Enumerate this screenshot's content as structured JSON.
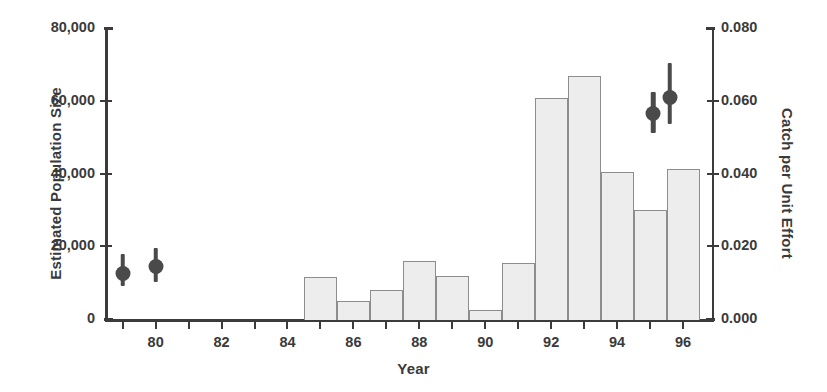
{
  "chart_data": {
    "type": "bar",
    "title": "",
    "xlabel": "Year",
    "ylabel": "Estimated Population Size",
    "ylabel_right": "Catch per Unit Effort",
    "grid": false,
    "legend": "none",
    "xlim": [
      78.5,
      96.9
    ],
    "ylim": [
      0,
      80000
    ],
    "ylim_right": [
      0.0,
      0.08
    ],
    "x_tick_values": [
      79,
      80,
      81,
      82,
      83,
      84,
      85,
      86,
      87,
      88,
      89,
      90,
      91,
      92,
      93,
      94,
      95,
      96
    ],
    "x_tick_labels": [
      "",
      "80",
      "",
      "82",
      "",
      "84",
      "",
      "86",
      "",
      "88",
      "",
      "90",
      "",
      "92",
      "",
      "94",
      "",
      "96"
    ],
    "y_tick_values": [
      0,
      20000,
      40000,
      60000,
      80000
    ],
    "y_tick_labels": [
      "0",
      "20,000",
      "40,000",
      "60,000",
      "80,000"
    ],
    "y_right_tick_values": [
      0.0,
      0.02,
      0.04,
      0.06,
      0.08
    ],
    "y_right_tick_labels": [
      "0.000",
      "0.020",
      "0.040",
      "0.060",
      "0.080"
    ],
    "series": [
      {
        "name": "Catch per Unit Effort",
        "type": "bar",
        "axis": "right",
        "bar_align": "year-interval",
        "categories": [
          85,
          86,
          87,
          88,
          89,
          90,
          91,
          92,
          93,
          94,
          95,
          96
        ],
        "values": [
          0.0118,
          0.0053,
          0.0083,
          0.0163,
          0.012,
          0.0027,
          0.0158,
          0.061,
          0.067,
          0.0407,
          0.0303,
          0.0415
        ],
        "values_left_axis": [
          11800,
          5300,
          8300,
          16300,
          12000,
          2700,
          15800,
          61000,
          67000,
          40700,
          30300,
          41500
        ]
      },
      {
        "name": "Estimated Population Size",
        "type": "scatter-errorbar",
        "axis": "left",
        "x": [
          79.0,
          80.0,
          95.1,
          95.6
        ],
        "values": [
          12600,
          14500,
          56500,
          61000
        ],
        "err_low": [
          9000,
          10200,
          51000,
          53500
        ],
        "err_high": [
          17800,
          19600,
          62500,
          70500
        ]
      }
    ]
  },
  "labels": {
    "y_left_title": "Estimated Population Size",
    "y_right_title": "Catch per Unit Effort",
    "x_title": "Year"
  },
  "colors": {
    "bar_fill": "#ededed",
    "bar_edge": "#8d8d8d",
    "marker": "#4a4a4a",
    "axis": "#3b3b3b",
    "text": "#3a3a3a",
    "background": "#ffffff"
  }
}
